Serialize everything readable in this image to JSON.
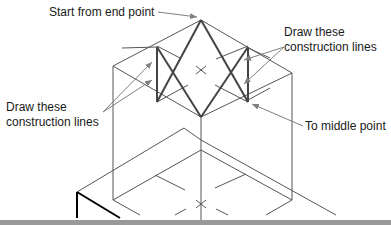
{
  "diagram": {
    "type": "isometric-construction-drawing",
    "labels": {
      "start_end_point": "Start from end point",
      "draw_lines_left_1": "Draw these",
      "draw_lines_left_2": "construction lines",
      "draw_lines_right_1": "Draw these",
      "draw_lines_right_2": "construction lines",
      "to_middle_point": "To middle point"
    },
    "colors": {
      "thin_line": "#555555",
      "bold_line": "#444444",
      "arrow": "#808080",
      "text": "#1a1a1a",
      "corner_bold": "#000000",
      "bottom_bar": "#9a9a9a"
    }
  }
}
